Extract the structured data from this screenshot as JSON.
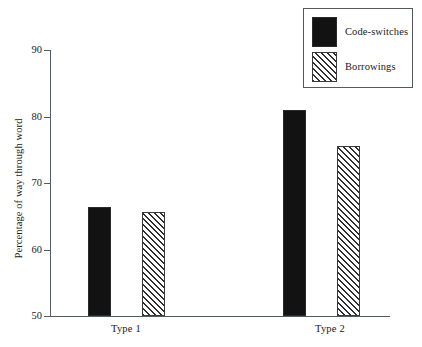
{
  "chart_data": {
    "type": "bar",
    "title": "",
    "xlabel": "",
    "ylabel": "Percentage of way through word",
    "categories": [
      "Type 1",
      "Type 2"
    ],
    "ylim": [
      50,
      90
    ],
    "yticks": [
      50,
      60,
      70,
      80,
      90
    ],
    "ytick_labels": [
      "50",
      "60",
      "70",
      "80",
      "90"
    ],
    "grid": false,
    "legend_position": "top-right",
    "series": [
      {
        "name": "Code-switches",
        "fill": "solid",
        "color": "#121212",
        "values": [
          66.4,
          81.0
        ]
      },
      {
        "name": "Borrowings",
        "fill": "diagonal-hatch",
        "color": "#2f2f2f",
        "values": [
          65.6,
          75.6
        ]
      }
    ]
  },
  "axes": {
    "y_title": "Percentage of way through word",
    "tick_50": "50",
    "tick_60": "60",
    "tick_70": "70",
    "tick_80": "80",
    "tick_90": "90"
  },
  "categories": {
    "type1": "Type 1",
    "type2": "Type 2"
  },
  "legend": {
    "entry_code_switches": "Code-switches",
    "entry_borrowings": "Borrowings"
  }
}
